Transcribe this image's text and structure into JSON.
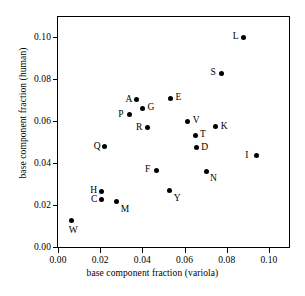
{
  "chart_data": {
    "type": "scatter",
    "title": "",
    "xlabel": "base component fraction (variola)",
    "ylabel": "base component fraction (human)",
    "xlim": [
      0.0,
      0.1095
    ],
    "ylim": [
      0.0,
      0.1095
    ],
    "xticks": [
      0.0,
      0.02,
      0.04,
      0.06,
      0.08,
      0.1
    ],
    "yticks": [
      0.0,
      0.02,
      0.04,
      0.06,
      0.08,
      0.1
    ],
    "xticklabels": [
      "0.00",
      "0.02",
      "0.04",
      "0.06",
      "0.08",
      "0.10"
    ],
    "yticklabels": [
      "0.00",
      "0.02",
      "0.04",
      "0.06",
      "0.08",
      "0.10"
    ],
    "grid": false,
    "legend": "none",
    "marker": "filled-circle",
    "marker_color": "#000000",
    "points": [
      {
        "label": "L",
        "x": 0.088,
        "y": 0.0998,
        "label_pos": "left"
      },
      {
        "label": "S",
        "x": 0.0775,
        "y": 0.0828,
        "label_pos": "left"
      },
      {
        "label": "E",
        "x": 0.0533,
        "y": 0.0707,
        "label_pos": "right"
      },
      {
        "label": "A",
        "x": 0.0372,
        "y": 0.07,
        "label_pos": "left"
      },
      {
        "label": "G",
        "x": 0.04,
        "y": 0.066,
        "label_pos": "right"
      },
      {
        "label": "P",
        "x": 0.0338,
        "y": 0.063,
        "label_pos": "left"
      },
      {
        "label": "V",
        "x": 0.0615,
        "y": 0.0598,
        "label_pos": "right"
      },
      {
        "label": "K",
        "x": 0.0748,
        "y": 0.0572,
        "label_pos": "right"
      },
      {
        "label": "R",
        "x": 0.0422,
        "y": 0.0567,
        "label_pos": "left"
      },
      {
        "label": "T",
        "x": 0.065,
        "y": 0.0533,
        "label_pos": "right"
      },
      {
        "label": "Q",
        "x": 0.0222,
        "y": 0.0478,
        "label_pos": "left"
      },
      {
        "label": "D",
        "x": 0.0655,
        "y": 0.0473,
        "label_pos": "right"
      },
      {
        "label": "I",
        "x": 0.094,
        "y": 0.0435,
        "label_pos": "left"
      },
      {
        "label": "F",
        "x": 0.0465,
        "y": 0.0365,
        "label_pos": "left"
      },
      {
        "label": "N",
        "x": 0.0702,
        "y": 0.036,
        "label_pos": "below-right"
      },
      {
        "label": "Y",
        "x": 0.053,
        "y": 0.0268,
        "label_pos": "below-right"
      },
      {
        "label": "H",
        "x": 0.0205,
        "y": 0.0266,
        "label_pos": "left"
      },
      {
        "label": "C",
        "x": 0.0208,
        "y": 0.0225,
        "label_pos": "left"
      },
      {
        "label": "M",
        "x": 0.0278,
        "y": 0.0215,
        "label_pos": "below-right"
      },
      {
        "label": "W",
        "x": 0.0065,
        "y": 0.0126,
        "label_pos": "below"
      }
    ]
  }
}
